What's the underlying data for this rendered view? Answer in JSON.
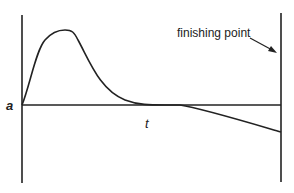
{
  "diagram": {
    "axis_origin_label": "a",
    "axis_time_label": "t",
    "annotation": "finishing point",
    "colors": {
      "line": "#222222",
      "background": "#ffffff"
    }
  }
}
